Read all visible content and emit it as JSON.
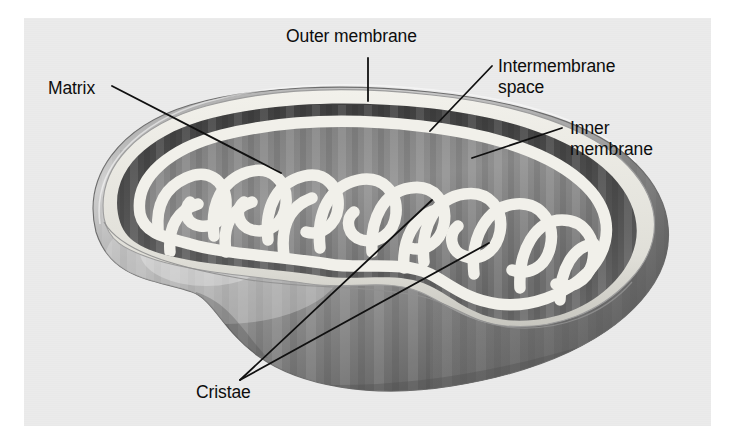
{
  "figure": {
    "style": "grayscale-airbrush-illustration",
    "background_color": "#ebebeb",
    "page_color": "#ffffff",
    "ink_color": "#0d0d0d"
  },
  "labels": {
    "outer_membrane": "Outer membrane",
    "intermembrane_space_line1": "Intermembrane",
    "intermembrane_space_line2": "space",
    "inner_membrane_line1": "Inner",
    "inner_membrane_line2": "membrane",
    "matrix": "Matrix",
    "cristae": "Cristae"
  },
  "palette": {
    "outer_membrane_rim": "#d8d8d8",
    "intermembrane_space": "#4f4f4f",
    "matrix_dark": "#6e6e6e",
    "matrix_mid": "#8d8d8d",
    "cristae_light": "#f0efe9",
    "body_shadow": "#5a5a5a",
    "body_highlight": "#c9c9c9",
    "leader_line": "#101010"
  },
  "leaders": {
    "outer_membrane": "vertical line from label down to outer membrane rim",
    "intermembrane_space": "diagonal line down-left to dark band",
    "inner_membrane": "diagonal line down-left to inner membrane fold",
    "matrix": "diagonal line down-right into matrix compartment",
    "cristae": "two converging lines up-right to two cristae folds"
  }
}
